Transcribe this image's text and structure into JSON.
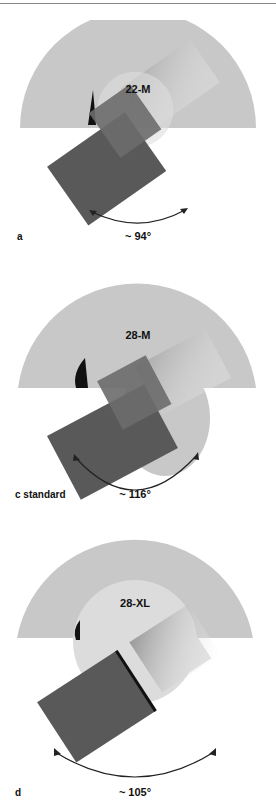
{
  "panels": [
    {
      "id": "a",
      "letter": "a",
      "size_label": "22-M",
      "angle": "~ 94°"
    },
    {
      "id": "c",
      "letter": "c standard",
      "size_label": "28-M",
      "angle": "~ 116°"
    },
    {
      "id": "d",
      "letter": "d",
      "size_label": "28-XL",
      "angle": "~ 105°"
    }
  ],
  "colors": {
    "cup": "#c8c8c8",
    "stem": "#595959",
    "ghost": "#e6e6e6"
  }
}
